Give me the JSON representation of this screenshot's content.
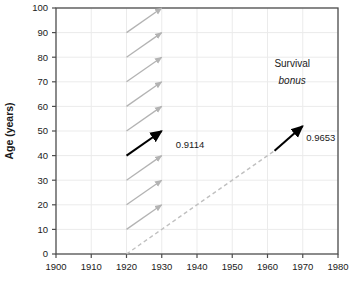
{
  "chart_data": {
    "type": "line",
    "title": "",
    "xlabel": "",
    "ylabel": "Age (years)",
    "xlim": [
      1900,
      1980
    ],
    "ylim": [
      0,
      100
    ],
    "xticks": [
      1900,
      1910,
      1920,
      1930,
      1940,
      1950,
      1960,
      1970,
      1980
    ],
    "xticklabels": [
      "1900",
      "1910",
      "1920",
      "1930",
      "1940",
      "1950",
      "1960",
      "1970",
      "1980"
    ],
    "yticks": [
      0,
      10,
      20,
      30,
      40,
      50,
      60,
      70,
      80,
      90,
      100
    ],
    "yticklabels": [
      "0",
      "10",
      "20",
      "30",
      "40",
      "50",
      "60",
      "70",
      "80",
      "90",
      "100"
    ],
    "grid": true,
    "grid_color": "#ebebeb",
    "legend": "none",
    "frame": true,
    "series": [
      {
        "name": "cohort-survival-arrows",
        "type": "arrow",
        "color": "#b3b3b3",
        "style": "solid",
        "arrows": [
          {
            "x0": 1920,
            "y0": 10,
            "x1": 1930,
            "y1": 20
          },
          {
            "x0": 1920,
            "y0": 20,
            "x1": 1930,
            "y1": 30
          },
          {
            "x0": 1920,
            "y0": 30,
            "x1": 1930,
            "y1": 40
          },
          {
            "x0": 1920,
            "y0": 50,
            "x1": 1930,
            "y1": 60
          },
          {
            "x0": 1920,
            "y0": 60,
            "x1": 1930,
            "y1": 70
          },
          {
            "x0": 1920,
            "y0": 70,
            "x1": 1930,
            "y1": 80
          },
          {
            "x0": 1920,
            "y0": 80,
            "x1": 1930,
            "y1": 90
          },
          {
            "x0": 1920,
            "y0": 90,
            "x1": 1930,
            "y1": 100
          }
        ]
      },
      {
        "name": "highlighted-period-arrow",
        "type": "arrow",
        "color": "#000000",
        "style": "solid",
        "arrows": [
          {
            "x0": 1920,
            "y0": 40,
            "x1": 1930,
            "y1": 50
          }
        ]
      },
      {
        "name": "cohort-diagonal",
        "type": "line",
        "color": "#c0c0c0",
        "style": "dashed",
        "points": [
          {
            "x": 1920,
            "y": 0
          },
          {
            "x": 1962,
            "y": 42
          }
        ]
      },
      {
        "name": "survival-bonus-arrow",
        "type": "arrow",
        "color": "#000000",
        "style": "solid",
        "arrows": [
          {
            "x0": 1962,
            "y0": 42,
            "x1": 1970,
            "y1": 52
          }
        ]
      }
    ],
    "annotations": [
      {
        "name": "period-probability",
        "text": "0.9114",
        "x": 1934,
        "y": 43
      },
      {
        "name": "cohort-probability",
        "text": "0.9653",
        "x": 1971,
        "y": 46
      },
      {
        "name": "survival-bonus-line1",
        "text": "Survival",
        "x": 1967,
        "y": 76,
        "style": "normal"
      },
      {
        "name": "survival-bonus-line2",
        "text": "bonus",
        "x": 1967,
        "y": 69,
        "style": "italic"
      }
    ]
  },
  "colors": {
    "axis": "#4d4d4d",
    "grid": "#ebebeb",
    "grey_arrow": "#b3b3b3",
    "dashed_line": "#c0c0c0",
    "black_arrow": "#000000",
    "text": "#1a1a1a",
    "background": "#ffffff"
  }
}
